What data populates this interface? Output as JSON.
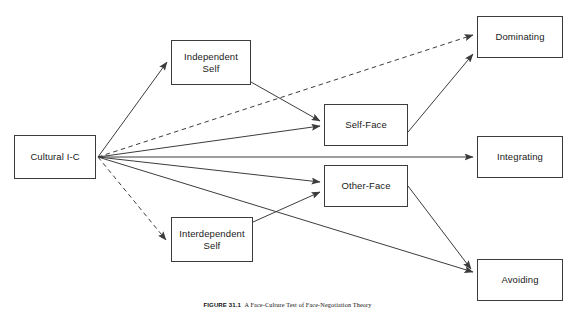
{
  "figure": {
    "caption_number": "FIGURE 31.1",
    "caption_text": "A Face-Culture Test of Face-Negotiation Theory",
    "line_color": "#3c3c3c",
    "box_border_color": "#3c3c3c",
    "text_color": "#1a1a1a",
    "background": "#ffffff"
  },
  "nodes": {
    "cultural_ic": {
      "label": "Cultural I-C",
      "x": 14,
      "y": 135,
      "w": 82,
      "h": 44
    },
    "independent_self": {
      "label": "Independent\nSelf",
      "x": 171,
      "y": 40,
      "w": 80,
      "h": 45
    },
    "interdependent_self": {
      "label": "Interdependent\nSelf",
      "x": 171,
      "y": 217,
      "w": 82,
      "h": 45
    },
    "self_face": {
      "label": "Self-Face",
      "x": 324,
      "y": 104,
      "w": 84,
      "h": 42
    },
    "other_face": {
      "label": "Other-Face",
      "x": 324,
      "y": 165,
      "w": 84,
      "h": 42
    },
    "dominating": {
      "label": "Dominating",
      "x": 477,
      "y": 16,
      "w": 86,
      "h": 42
    },
    "integrating": {
      "label": "Integrating",
      "x": 477,
      "y": 136,
      "w": 86,
      "h": 42
    },
    "avoiding": {
      "label": "Avoiding",
      "x": 477,
      "y": 259,
      "w": 86,
      "h": 42
    }
  },
  "edges": [
    {
      "name": "cultural-ic-to-independent-self",
      "from": "cultural_ic",
      "to": "independent_self",
      "style": "solid"
    },
    {
      "name": "cultural-ic-to-interdependent-self",
      "from": "cultural_ic",
      "to": "interdependent_self",
      "style": "dashed"
    },
    {
      "name": "cultural-ic-to-self-face",
      "from": "cultural_ic",
      "to": "self_face",
      "style": "solid"
    },
    {
      "name": "cultural-ic-to-other-face",
      "from": "cultural_ic",
      "to": "other_face",
      "style": "solid"
    },
    {
      "name": "cultural-ic-to-dominating",
      "from": "cultural_ic",
      "to": "dominating",
      "style": "dashed"
    },
    {
      "name": "cultural-ic-to-integrating",
      "from": "cultural_ic",
      "to": "integrating",
      "style": "solid"
    },
    {
      "name": "cultural-ic-to-avoiding",
      "from": "cultural_ic",
      "to": "avoiding",
      "style": "solid"
    },
    {
      "name": "independent-self-to-self-face",
      "from": "independent_self",
      "to": "self_face",
      "style": "solid"
    },
    {
      "name": "interdependent-self-to-other-face",
      "from": "interdependent_self",
      "to": "other_face",
      "style": "solid"
    },
    {
      "name": "self-face-to-dominating",
      "from": "self_face",
      "to": "dominating",
      "style": "solid"
    },
    {
      "name": "other-face-to-avoiding",
      "from": "other_face",
      "to": "avoiding",
      "style": "solid"
    }
  ],
  "edge_paths": {
    "cultural-ic-to-independent-self": "M 98,157 L 167,62",
    "cultural-ic-to-interdependent-self": "M 98,157 L 166,240",
    "cultural-ic-to-self-face": "M 98,157 L 320,126",
    "cultural-ic-to-other-face": "M 98,157 L 320,182",
    "cultural-ic-to-dominating": "M 98,157 L 473,35",
    "cultural-ic-to-integrating": "M 98,157 L 473,157",
    "cultural-ic-to-avoiding": "M 98,157 L 473,272",
    "independent-self-to-self-face": "M 251,82 L 320,121",
    "interdependent-self-to-other-face": "M 253,222 L 320,192",
    "self-face-to-dominating": "M 408,132 L 473,54",
    "other-face-to-avoiding": "M 408,186 L 471,269"
  }
}
